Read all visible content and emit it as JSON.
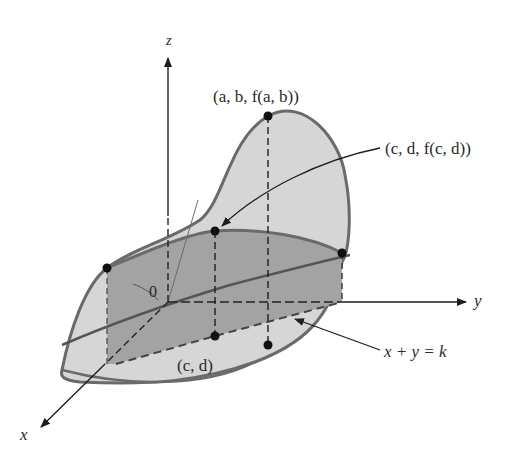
{
  "diagram": {
    "axes": {
      "z_label": "z",
      "y_label": "y",
      "x_label": "x",
      "origin_label": "0"
    },
    "labels": {
      "max_point": "(a, b, f(a, b))",
      "curve_point": "(c, d, f(c, d))",
      "domain_point": "(c, d)",
      "line_equation": "x + y = k"
    },
    "colors": {
      "surface_light": "#d6d6d6",
      "surface_dark": "#a3a3a3",
      "outline": "#6a6a6a",
      "ink": "#1e1e1e"
    }
  }
}
